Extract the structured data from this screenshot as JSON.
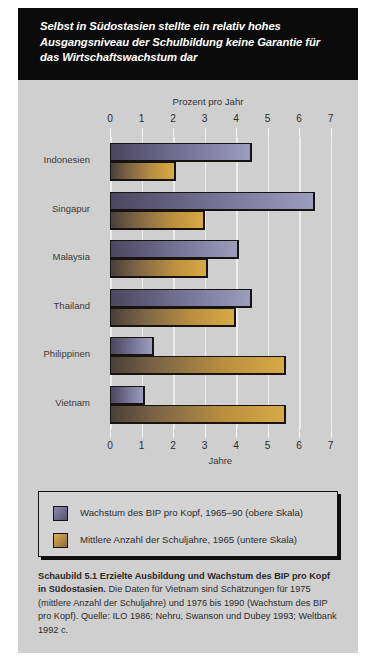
{
  "title": "Selbst in Südostasien stellte ein relativ hohes Ausgangsniveau der Schulbildung keine Garantie für das Wirtschaftswachstum dar",
  "axes": {
    "top_title": "Prozent pro Jahr",
    "bottom_title": "Jahre",
    "ticks": [
      "0",
      "1",
      "2",
      "3",
      "4",
      "5",
      "6",
      "7"
    ]
  },
  "legend": {
    "items": [
      {
        "label": "Wachstum des BIP pro Kopf, 1965–90 (obere Skala)",
        "swatch": "purple",
        "color": "#6a6686"
      },
      {
        "label": "Mittlere Anzahl der Schuljahre, 1965 (untere Skala)",
        "swatch": "gold",
        "color": "#b98f3f"
      }
    ]
  },
  "caption": {
    "bold": "Schaubild 5.1   Erzielte Ausbildung und Wachstum des BIP pro Kopf in Südostasien.",
    "rest": " Die Daten für Vietnam sind Schätzungen für 1975 (mittlere Anzahl der Schuljahre) und 1976 bis 1990 (Wachstum des BIP pro Kopf). Quelle: ILO 1986; Nehru, Swanson und Dubey 1993; Weltbank 1992 c."
  },
  "chart_data": {
    "type": "bar",
    "orientation": "horizontal",
    "title": "Selbst in Südostasien stellte ein relativ hohes Ausgangsniveau der Schulbildung keine Garantie für das Wirtschaftswachstum dar",
    "categories": [
      "Indonesien",
      "Singapur",
      "Malaysia",
      "Thailand",
      "Philippinen",
      "Vietnam"
    ],
    "series": [
      {
        "name": "Wachstum des BIP pro Kopf, 1965–90 (obere Skala)",
        "axis": "top",
        "unit": "Prozent pro Jahr",
        "color": "#6a6686",
        "values": [
          4.5,
          6.5,
          4.1,
          4.5,
          1.4,
          1.1
        ]
      },
      {
        "name": "Mittlere Anzahl der Schuljahre, 1965 (untere Skala)",
        "axis": "bottom",
        "unit": "Jahre",
        "color": "#b98f3f",
        "values": [
          2.1,
          3.0,
          3.1,
          4.0,
          5.6,
          5.6
        ]
      }
    ],
    "xlabel_top": "Prozent pro Jahr",
    "xlabel_bottom": "Jahre",
    "ylabel": "",
    "xlim": [
      0,
      7
    ],
    "xticks": [
      0,
      1,
      2,
      3,
      4,
      5,
      6,
      7
    ],
    "grid": true,
    "legend_position": "bottom"
  }
}
